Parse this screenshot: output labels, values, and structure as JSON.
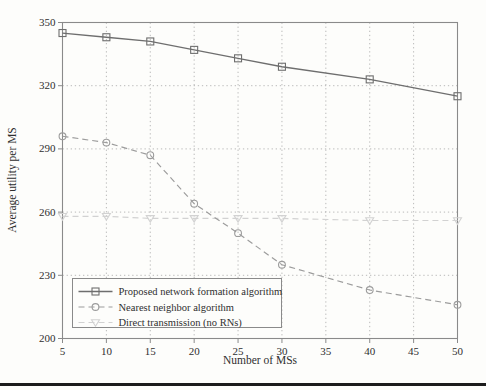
{
  "page": {
    "background": "#fdfdfb",
    "footer_rule_color": "#1c1c1c"
  },
  "chart_data": {
    "type": "line",
    "title": "",
    "xlabel": "Number of MSs",
    "ylabel": "Average utility per MS",
    "xlim": [
      5,
      50
    ],
    "ylim": [
      200,
      350
    ],
    "xticks": [
      5,
      10,
      15,
      20,
      25,
      30,
      35,
      40,
      45,
      50
    ],
    "yticks": [
      200,
      230,
      260,
      290,
      320,
      350
    ],
    "grid": "dotted",
    "grid_color": "#a8a8a8",
    "frame_color": "#8a8a8a",
    "legend_position": "lower-left",
    "x": [
      5,
      10,
      15,
      20,
      25,
      30,
      40,
      50
    ],
    "series": [
      {
        "name": "Proposed network formation algorithm",
        "values": [
          345,
          343,
          341,
          337,
          333,
          329,
          323,
          315
        ],
        "line": "solid",
        "marker": "square",
        "color": "#6e6e6e"
      },
      {
        "name": "Nearest neighbor algorithm",
        "values": [
          296,
          293,
          287,
          264,
          250,
          235,
          223,
          216
        ],
        "line": "dashed",
        "marker": "circle",
        "color": "#9c9c9c"
      },
      {
        "name": "Direct transmission (no RNs)",
        "values": [
          258,
          258,
          257,
          257,
          257,
          257,
          256,
          256
        ],
        "line": "dashed",
        "marker": "triangle-down",
        "color": "#d2d2d2"
      }
    ]
  }
}
